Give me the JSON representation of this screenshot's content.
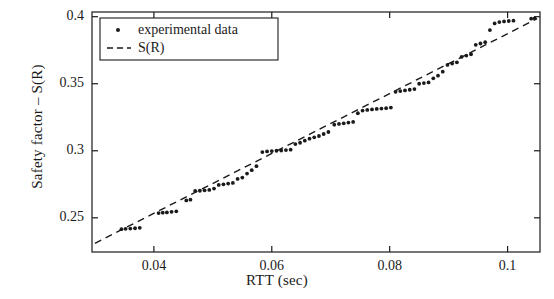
{
  "chart_data": {
    "type": "scatter",
    "title": "",
    "xlabel": "RTT (sec)",
    "ylabel": "Safety factor – S(R)",
    "xlim": [
      0.0295,
      0.1055
    ],
    "ylim": [
      0.2245,
      0.4035
    ],
    "xticks": [
      0.04,
      0.06,
      0.08,
      0.1
    ],
    "xticklabels": [
      "0.04",
      "0.06",
      "0.08",
      "0.1"
    ],
    "yticks": [
      0.25,
      0.3,
      0.35,
      0.4
    ],
    "yticklabels": [
      "0.25",
      "0.3",
      "0.35",
      "0.4"
    ],
    "grid": false,
    "legend": {
      "position": "top-left",
      "entries": [
        {
          "label": "experimental data",
          "marker": "dot",
          "color": "#1a1a1a"
        },
        {
          "label": "S(R)",
          "marker": "dashed-line",
          "color": "#1a1a1a"
        }
      ]
    },
    "series": [
      {
        "name": "experimental data",
        "type": "scatter",
        "color": "#1a1a1a",
        "points": [
          [
            0.0345,
            0.2415
          ],
          [
            0.0352,
            0.2418
          ],
          [
            0.036,
            0.242
          ],
          [
            0.0368,
            0.2422
          ],
          [
            0.0376,
            0.2425
          ],
          [
            0.0408,
            0.2535
          ],
          [
            0.0415,
            0.2538
          ],
          [
            0.0422,
            0.254
          ],
          [
            0.043,
            0.2545
          ],
          [
            0.0438,
            0.2548
          ],
          [
            0.0455,
            0.263
          ],
          [
            0.0462,
            0.2635
          ],
          [
            0.047,
            0.27
          ],
          [
            0.0478,
            0.2702
          ],
          [
            0.0486,
            0.2705
          ],
          [
            0.0494,
            0.2708
          ],
          [
            0.0502,
            0.2718
          ],
          [
            0.051,
            0.2745
          ],
          [
            0.0518,
            0.275
          ],
          [
            0.0526,
            0.2755
          ],
          [
            0.0534,
            0.276
          ],
          [
            0.0542,
            0.279
          ],
          [
            0.055,
            0.28
          ],
          [
            0.0558,
            0.283
          ],
          [
            0.0566,
            0.2855
          ],
          [
            0.0574,
            0.2885
          ],
          [
            0.0584,
            0.299
          ],
          [
            0.0592,
            0.2995
          ],
          [
            0.06,
            0.2998
          ],
          [
            0.0608,
            0.3
          ],
          [
            0.0616,
            0.3002
          ],
          [
            0.0624,
            0.3005
          ],
          [
            0.0632,
            0.3008
          ],
          [
            0.064,
            0.305
          ],
          [
            0.0648,
            0.306
          ],
          [
            0.0656,
            0.3075
          ],
          [
            0.0664,
            0.309
          ],
          [
            0.0672,
            0.31
          ],
          [
            0.068,
            0.311
          ],
          [
            0.0688,
            0.3125
          ],
          [
            0.0696,
            0.314
          ],
          [
            0.0706,
            0.3195
          ],
          [
            0.0714,
            0.32
          ],
          [
            0.0722,
            0.3205
          ],
          [
            0.073,
            0.321
          ],
          [
            0.0738,
            0.3215
          ],
          [
            0.0746,
            0.328
          ],
          [
            0.0754,
            0.33
          ],
          [
            0.0762,
            0.3305
          ],
          [
            0.077,
            0.3308
          ],
          [
            0.0778,
            0.3312
          ],
          [
            0.0786,
            0.3315
          ],
          [
            0.0794,
            0.3318
          ],
          [
            0.0802,
            0.3322
          ],
          [
            0.081,
            0.344
          ],
          [
            0.0818,
            0.3445
          ],
          [
            0.0826,
            0.345
          ],
          [
            0.0834,
            0.3455
          ],
          [
            0.0842,
            0.346
          ],
          [
            0.085,
            0.35
          ],
          [
            0.0858,
            0.3505
          ],
          [
            0.0866,
            0.351
          ],
          [
            0.0874,
            0.354
          ],
          [
            0.0882,
            0.356
          ],
          [
            0.089,
            0.359
          ],
          [
            0.0898,
            0.364
          ],
          [
            0.0906,
            0.365
          ],
          [
            0.0914,
            0.366
          ],
          [
            0.0922,
            0.37
          ],
          [
            0.093,
            0.371
          ],
          [
            0.0938,
            0.372
          ],
          [
            0.0946,
            0.379
          ],
          [
            0.0954,
            0.38
          ],
          [
            0.0962,
            0.381
          ],
          [
            0.097,
            0.39
          ],
          [
            0.0978,
            0.395
          ],
          [
            0.0986,
            0.396
          ],
          [
            0.0994,
            0.3965
          ],
          [
            0.1002,
            0.3968
          ],
          [
            0.101,
            0.397
          ],
          [
            0.104,
            0.3985
          ],
          [
            0.1046,
            0.3988
          ]
        ]
      },
      {
        "name": "S(R)",
        "type": "line",
        "style": "dashed",
        "color": "#1a1a1a",
        "points": [
          [
            0.03,
            0.231
          ],
          [
            0.105,
            0.3985
          ]
        ]
      }
    ]
  },
  "axes": {
    "xlabel": "RTT (sec)",
    "ylabel": "Safety factor – S(R)"
  },
  "legend": {
    "entry_0": "experimental data",
    "entry_1": "S(R)"
  },
  "ticks": {
    "x": [
      "0.04",
      "0.06",
      "0.08",
      "0.1"
    ],
    "y": [
      "0.25",
      "0.3",
      "0.35",
      "0.4"
    ]
  }
}
